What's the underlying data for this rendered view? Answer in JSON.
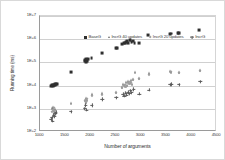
{
  "chart_data": {
    "type": "scatter",
    "title": "",
    "xlabel": "Number of arguments",
    "ylabel": "Running time (ms)",
    "xlim": [
      1000,
      4500
    ],
    "ylim": [
      100,
      10000000
    ],
    "yscale": "log",
    "xscale": "linear",
    "grid": true,
    "legend_position": "top-inside",
    "xticks": [
      "1000",
      "1500",
      "2000",
      "2500",
      "3000",
      "3500",
      "4000",
      "4500"
    ],
    "xtick_values": [
      1000,
      1500,
      2000,
      2500,
      3000,
      3500,
      4000,
      4500
    ],
    "yticks": [
      "1E+2",
      "1E+3",
      "1E+4",
      "1E+5",
      "1E+6",
      "1E+7"
    ],
    "ytick_values": [
      100,
      1000,
      10000,
      100000,
      1000000,
      10000000
    ],
    "series": [
      {
        "name": "BaseG",
        "marker": "square",
        "color": "#2f2f2f",
        "points": [
          [
            1210,
            9500
          ],
          [
            1230,
            10000
          ],
          [
            1245,
            10500
          ],
          [
            1255,
            9800
          ],
          [
            1265,
            11000
          ],
          [
            1275,
            10200
          ],
          [
            1290,
            11500
          ],
          [
            1300,
            10800
          ],
          [
            1315,
            12000
          ],
          [
            1330,
            11200
          ],
          [
            1610,
            40000
          ],
          [
            1880,
            110000
          ],
          [
            1895,
            125000
          ],
          [
            1905,
            100000
          ],
          [
            1915,
            135000
          ],
          [
            1930,
            118000
          ],
          [
            1945,
            145000
          ],
          [
            2020,
            160000
          ],
          [
            2220,
            260000
          ],
          [
            2500,
            430000
          ],
          [
            2530,
            400000
          ],
          [
            2630,
            620000
          ],
          [
            2660,
            680000
          ],
          [
            2680,
            700000
          ],
          [
            2700,
            760000
          ],
          [
            2720,
            820000
          ],
          [
            2745,
            700000
          ],
          [
            2770,
            900000
          ],
          [
            2790,
            880000
          ],
          [
            2810,
            760000
          ],
          [
            2840,
            820000
          ],
          [
            2870,
            700000
          ],
          [
            2955,
            660000
          ],
          [
            3145,
            1500000
          ],
          [
            3570,
            1700000
          ],
          [
            3600,
            1750000
          ],
          [
            3720,
            1800000
          ],
          [
            3740,
            1850000
          ],
          [
            3755,
            1780000
          ],
          [
            4150,
            2400000
          ]
        ]
      },
      {
        "name": "IncrG 40 updates",
        "marker": "triangle",
        "color": "#6a6a6a",
        "points": [
          [
            1230,
            1100
          ],
          [
            1250,
            950
          ],
          [
            1265,
            1250
          ],
          [
            1280,
            800
          ],
          [
            1300,
            1000
          ],
          [
            1615,
            1700
          ],
          [
            1880,
            2400
          ],
          [
            1900,
            2000
          ],
          [
            1915,
            2900
          ],
          [
            1930,
            2300
          ],
          [
            2020,
            4200
          ],
          [
            2225,
            4800
          ],
          [
            2500,
            5500
          ],
          [
            2620,
            9000
          ],
          [
            2650,
            12000
          ],
          [
            2680,
            10000
          ],
          [
            2700,
            14000
          ],
          [
            2720,
            11000
          ],
          [
            2745,
            16000
          ],
          [
            2770,
            13000
          ],
          [
            2790,
            18000
          ],
          [
            2810,
            12000
          ],
          [
            2845,
            20000
          ],
          [
            2880,
            40000
          ],
          [
            2960,
            22000
          ],
          [
            3150,
            34000
          ],
          [
            3580,
            42000
          ],
          [
            3600,
            40000
          ],
          [
            3740,
            40000
          ],
          [
            4160,
            48000
          ]
        ]
      },
      {
        "name": "IncrG 20 updates",
        "marker": "diamond",
        "color": "#9d9d9d",
        "points": [
          [
            1235,
            700
          ],
          [
            1255,
            900
          ],
          [
            1270,
            1050
          ],
          [
            1290,
            800
          ],
          [
            1890,
            2100
          ],
          [
            1910,
            1800
          ],
          [
            1925,
            2600
          ],
          [
            2030,
            3600
          ],
          [
            2235,
            4000
          ],
          [
            2510,
            4600
          ],
          [
            2630,
            8000
          ],
          [
            2660,
            9500
          ],
          [
            2690,
            11000
          ],
          [
            2710,
            9000
          ],
          [
            2735,
            13000
          ],
          [
            2760,
            11500
          ],
          [
            2785,
            15000
          ],
          [
            2805,
            12500
          ],
          [
            2835,
            17000
          ],
          [
            2955,
            20000
          ],
          [
            3160,
            30000
          ],
          [
            3590,
            38000
          ],
          [
            3745,
            36000
          ],
          [
            4165,
            42000
          ]
        ]
      },
      {
        "name": "IncrG",
        "marker": "plus",
        "color": "#5a5a5a",
        "points": [
          [
            1215,
            350
          ],
          [
            1235,
            420
          ],
          [
            1250,
            300
          ],
          [
            1268,
            550
          ],
          [
            1285,
            480
          ],
          [
            1300,
            620
          ],
          [
            1315,
            700
          ],
          [
            1610,
            750
          ],
          [
            1885,
            1000
          ],
          [
            1900,
            1400
          ],
          [
            1920,
            900
          ],
          [
            2025,
            1400
          ],
          [
            2230,
            2600
          ],
          [
            2505,
            3000
          ],
          [
            2640,
            4200
          ],
          [
            2670,
            3600
          ],
          [
            2695,
            4800
          ],
          [
            2715,
            4000
          ],
          [
            2740,
            5200
          ],
          [
            2765,
            4500
          ],
          [
            2790,
            6000
          ],
          [
            2815,
            5000
          ],
          [
            2850,
            7000
          ],
          [
            2965,
            4300
          ],
          [
            3155,
            6500
          ],
          [
            3575,
            11000
          ],
          [
            3605,
            11500
          ],
          [
            3750,
            11000
          ],
          [
            4170,
            15000
          ]
        ]
      }
    ]
  },
  "legend": {
    "items": [
      {
        "label": "BaseG",
        "marker": "square"
      },
      {
        "label": "IncrG 40 updates",
        "marker": "triangle"
      },
      {
        "label": "IncrG 20 updates",
        "marker": "diamond"
      },
      {
        "label": "IncrG",
        "marker": "plus"
      }
    ]
  },
  "axes": {
    "x_title": "Number of arguments",
    "y_title": "Running time (ms)"
  }
}
